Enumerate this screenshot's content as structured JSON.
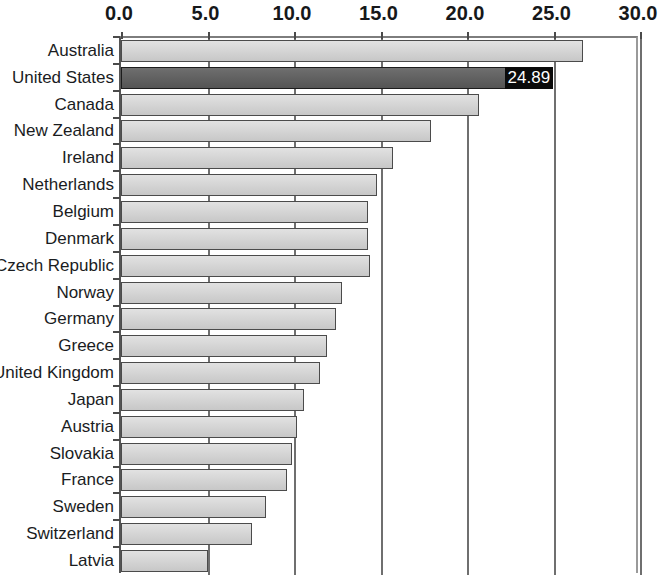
{
  "chart_data": {
    "type": "bar",
    "orientation": "horizontal",
    "title": "",
    "subtitle": "",
    "xlabel": "",
    "ylabel": "",
    "xlim": [
      0.0,
      30.0
    ],
    "xticks": [
      "0.0",
      "5.0",
      "10.0",
      "15.0",
      "20.0",
      "25.0",
      "30.0"
    ],
    "xtick_values": [
      0.0,
      5.0,
      10.0,
      15.0,
      20.0,
      25.0,
      30.0
    ],
    "grid": true,
    "legend": "none",
    "highlight_category": "United States",
    "highlight_label": "24.89",
    "categories": [
      "Australia",
      "United States",
      "Canada",
      "New Zealand",
      "Ireland",
      "Netherlands",
      "Belgium",
      "Denmark",
      "Czech Republic",
      "Norway",
      "Germany",
      "Greece",
      "United Kingdom",
      "Japan",
      "Austria",
      "Slovakia",
      "France",
      "Sweden",
      "Switzerland",
      "Latvia"
    ],
    "values": [
      26.7,
      24.89,
      20.7,
      17.9,
      15.7,
      14.8,
      14.3,
      14.3,
      14.4,
      12.8,
      12.4,
      11.9,
      11.5,
      10.6,
      10.2,
      9.9,
      9.6,
      8.4,
      7.6,
      5.0
    ],
    "colors": {
      "bar_fill": "#d2d2d2",
      "bar_border": "#4b4b4b",
      "highlight_fill": "#5e5e5e",
      "highlight_border": "#1c1c1c",
      "label_box_fill": "#0b0b0b",
      "label_box_text": "#ffffff",
      "axis": "#545454",
      "text": "#1a1c1e",
      "background": "#ffffff"
    }
  }
}
